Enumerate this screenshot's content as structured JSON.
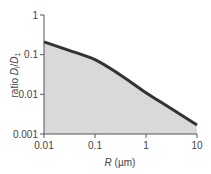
{
  "chart_data": {
    "type": "area",
    "title": "",
    "xlabel": "R (µm)",
    "ylabel": "ratio D_i/D_1",
    "xscale": "log",
    "yscale": "log",
    "xlim": [
      0.01,
      10
    ],
    "ylim": [
      0.001,
      1
    ],
    "x_ticks": [
      "0.01",
      "0.1",
      "1",
      "10"
    ],
    "y_ticks": [
      "0.001",
      "0.01",
      "0.1",
      "1"
    ],
    "grid": false,
    "legend": null,
    "series": [
      {
        "name": "D_i/D_1",
        "x": [
          0.01,
          0.03,
          0.1,
          0.3,
          1,
          3,
          10
        ],
        "values": [
          0.21,
          0.13,
          0.075,
          0.032,
          0.011,
          0.0045,
          0.0017
        ],
        "fill_below": true
      }
    ],
    "colors": {
      "line": "#333333",
      "fill": "#d9d9d9",
      "axis": "#555555",
      "text": "#444444"
    }
  },
  "labels": {
    "xlabel_italic": "R",
    "xlabel_unit": " (µm)",
    "ylabel_prefix": "ratio ",
    "ylabel_D": "D",
    "ylabel_sub_i": "i",
    "ylabel_slash": "/",
    "ylabel_sub_1": "1"
  }
}
